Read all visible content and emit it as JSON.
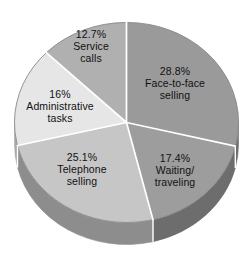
{
  "chart_data": {
    "type": "pie",
    "title": "",
    "subtitle": "",
    "xlabel": "",
    "ylabel": "",
    "legend": "none",
    "grid": false,
    "style": "3d-pie",
    "start_angle_deg": 0,
    "direction": "clockwise",
    "categories": [
      "Face-to-face selling",
      "Waiting/ traveling",
      "Telephone selling",
      "Administrative tasks",
      "Service calls"
    ],
    "values": [
      28.8,
      17.4,
      25.1,
      16,
      12.7
    ],
    "value_unit": "%",
    "slices": [
      {
        "name": "Face-to-face selling",
        "value": 28.8,
        "label_pct": "28.8%",
        "label_line1": "Face-to-face",
        "label_line2": "selling",
        "color": "#9a9a9a",
        "side_color": "#6f6f6f"
      },
      {
        "name": "Waiting/ traveling",
        "value": 17.4,
        "label_pct": "17.4%",
        "label_line1": "Waiting/",
        "label_line2": "traveling",
        "color": "#9d9d9d",
        "side_color": "#6d6d6d"
      },
      {
        "name": "Telephone selling",
        "value": 25.1,
        "label_pct": "25.1%",
        "label_line1": "Telephone",
        "label_line2": "selling",
        "color": "#c6c6c6",
        "side_color": "#8d8d8d"
      },
      {
        "name": "Administrative tasks",
        "value": 16,
        "label_pct": "16%",
        "label_line1": "Administrative",
        "label_line2": "tasks",
        "color": "#e6e6e6",
        "side_color": "#a8a8a8"
      },
      {
        "name": "Service calls",
        "value": 12.7,
        "label_pct": "12.7%",
        "label_line1": "Service",
        "label_line2": "calls",
        "color": "#b0b0b0",
        "side_color": "#808080"
      }
    ],
    "colors": {
      "background": "#ffffff",
      "divider": "#ffffff",
      "outline": "#8a8a8a",
      "text": "#111111"
    }
  }
}
